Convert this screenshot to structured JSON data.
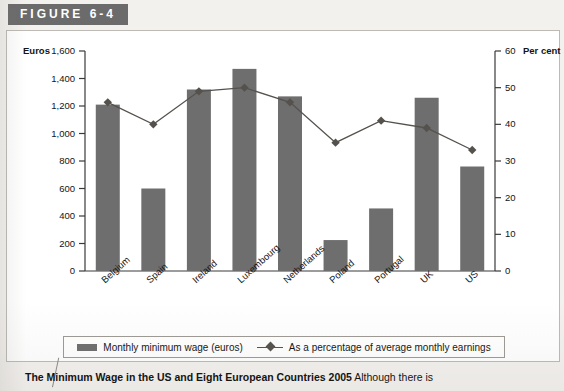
{
  "figure": {
    "badge_label": "FIGURE 6-4"
  },
  "caption": {
    "title": "The Minimum Wage in the US and Eight European Countries 2005",
    "body": "Although there is"
  },
  "legend": {
    "items": [
      {
        "label": "Monthly minimum wage (euros)",
        "marker": "bar-swatch",
        "color": "#6e6e6e"
      },
      {
        "label": "As a percentage of average monthly earnings",
        "marker": "line-diamond-marker",
        "color": "#55524e"
      }
    ]
  },
  "chart_data": {
    "type": "bar",
    "title": "The Minimum Wage in the US and Eight European Countries 2005",
    "categories": [
      "Belgium",
      "Spain",
      "Ireland",
      "Luxembourg",
      "Netherlands",
      "Poland",
      "Portugal",
      "UK",
      "US"
    ],
    "series": [
      {
        "name": "Monthly minimum wage (euros)",
        "type": "bar",
        "axis": "left",
        "values": [
          1210,
          600,
          1320,
          1470,
          1270,
          225,
          455,
          1260,
          760
        ]
      },
      {
        "name": "As a percentage of average monthly earnings",
        "type": "line",
        "axis": "right",
        "values": [
          46,
          40,
          49,
          50,
          46,
          35,
          41,
          39,
          33
        ]
      }
    ],
    "xlabel": "",
    "ylabel": "Euros",
    "ylabel_right": "Per cent",
    "ylim": [
      0,
      1600
    ],
    "ylim_right": [
      0,
      60
    ],
    "yticks": [
      0,
      200,
      400,
      600,
      800,
      1000,
      1200,
      1400,
      1600
    ],
    "ytick_labels": [
      "0",
      "200",
      "400",
      "600",
      "800",
      "1,000",
      "1,200",
      "1,400",
      "1,600"
    ],
    "yticks_right": [
      0,
      10,
      20,
      30,
      40,
      50,
      60
    ],
    "ytick_labels_right": [
      "0",
      "10",
      "20",
      "30",
      "40",
      "50",
      "60"
    ],
    "grid": false,
    "legend_position": "bottom"
  }
}
